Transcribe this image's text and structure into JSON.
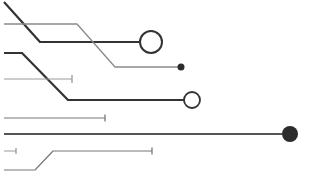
{
  "image": {
    "description": "Circuit-trace style line illustration with terminal nodes",
    "width": 312,
    "height": 179,
    "background": "#ffffff"
  },
  "colors": {
    "dark": "#333333",
    "medium": "#555555",
    "light": "#8a8a8a",
    "node_fill_dark": "#2b2b2b",
    "node_hollow_fill": "#ffffff"
  },
  "traces": [
    {
      "id": "trace-1",
      "points": "4,2 40,42 140,42",
      "stroke": "#333333",
      "width": 2.2,
      "terminal": {
        "type": "hollow-circle",
        "cx": 151,
        "cy": 42,
        "r": 11,
        "stroke_width": 2
      }
    },
    {
      "id": "trace-2",
      "points": "4,24 77,24 115,67 178,67",
      "stroke": "#8a8a8a",
      "width": 1.3,
      "terminal": {
        "type": "filled-circle",
        "cx": 181,
        "cy": 67,
        "r": 3.5
      }
    },
    {
      "id": "trace-3",
      "points": "4,53 22,53 68,100 184,100",
      "stroke": "#333333",
      "width": 2.2,
      "terminal": {
        "type": "hollow-circle",
        "cx": 192,
        "cy": 100,
        "r": 8,
        "stroke_width": 1.8
      }
    },
    {
      "id": "trace-4",
      "points": "4,79 72,79",
      "stroke": "#9a9a9a",
      "width": 1,
      "terminal": {
        "type": "tick",
        "x": 72,
        "y": 79,
        "h": 8
      }
    },
    {
      "id": "trace-5",
      "points": "4,118 105,118",
      "stroke": "#777777",
      "width": 1.2,
      "terminal": {
        "type": "tick",
        "x": 105,
        "y": 118,
        "h": 7
      }
    },
    {
      "id": "trace-6",
      "points": "4,134 282,134",
      "stroke": "#555555",
      "width": 1.8,
      "terminal": {
        "type": "filled-circle",
        "cx": 290,
        "cy": 134,
        "r": 8
      }
    },
    {
      "id": "trace-7",
      "points": "4,151 16,151",
      "stroke": "#9a9a9a",
      "width": 1,
      "terminal": {
        "type": "tick",
        "x": 16,
        "y": 151,
        "h": 6
      }
    },
    {
      "id": "trace-8",
      "points": "4,170 35,170 53,151 152,151",
      "stroke": "#777777",
      "width": 1.2,
      "terminal": {
        "type": "tick",
        "x": 152,
        "y": 151,
        "h": 7
      }
    }
  ]
}
